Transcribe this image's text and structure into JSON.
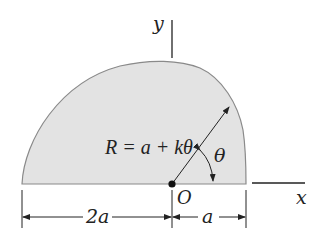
{
  "diagram": {
    "axes": {
      "x_label": "x",
      "y_label": "y",
      "origin_label": "O"
    },
    "curve_equation": "R = a + kθ",
    "angle_label": "θ",
    "dimensions": {
      "left": "2a",
      "right": "a"
    },
    "colors": {
      "fill": "#e3e3e3",
      "stroke": "#8a8a8a",
      "ink": "#222222"
    }
  }
}
